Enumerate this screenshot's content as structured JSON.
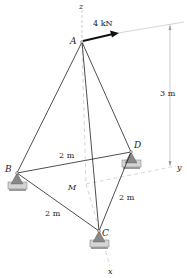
{
  "figure": {
    "type": "3d tripod statics diagram",
    "points": {
      "A": "A",
      "B": "B",
      "C": "C",
      "D": "D",
      "M": "M"
    },
    "axes": {
      "x": "x",
      "y": "y",
      "z": "z"
    },
    "force": {
      "label": "4 kN",
      "applied_at": "A"
    },
    "dimensions": {
      "height": "3 m",
      "BD": "2 m",
      "BC": "2 m",
      "CD": "2 m"
    },
    "colors": {
      "line": "#222222",
      "axis": "#9a9a9a",
      "support": "#8a8a8a"
    }
  }
}
